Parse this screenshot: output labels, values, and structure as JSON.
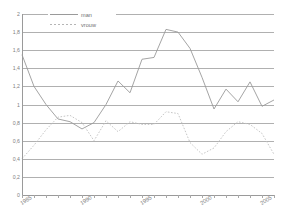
{
  "chart_data": {
    "type": "line",
    "title": "",
    "xlabel": "",
    "ylabel": "",
    "ylim": [
      0,
      2
    ],
    "xlim": [
      1985,
      2006
    ],
    "grid": true,
    "legend_position": "top-left",
    "y_ticks": [
      "2",
      "1,8",
      "1,6",
      "1,4",
      "1,2",
      "1",
      "0,8",
      "0,6",
      "0,4",
      "0,2",
      "0"
    ],
    "y_tick_values": [
      2,
      1.8,
      1.6,
      1.4,
      1.2,
      1,
      0.8,
      0.6,
      0.4,
      0.2,
      0
    ],
    "x_tick_labels": [
      "1985",
      "1990",
      "1995",
      "2000",
      "2005"
    ],
    "x_tick_values": [
      1985,
      1990,
      1995,
      2000,
      2005
    ],
    "x": [
      1985,
      1986,
      1987,
      1988,
      1989,
      1990,
      1991,
      1992,
      1993,
      1994,
      1995,
      1996,
      1997,
      1998,
      1999,
      2000,
      2001,
      2002,
      2003,
      2004,
      2005,
      2006
    ],
    "series": [
      {
        "name": "man",
        "style": "solid",
        "color": "#9a9a9a",
        "values": [
          1.55,
          1.2,
          1.0,
          0.84,
          0.81,
          0.73,
          0.8,
          1.0,
          1.26,
          1.13,
          1.5,
          1.52,
          1.83,
          1.8,
          1.62,
          1.3,
          0.95,
          1.17,
          1.03,
          1.25,
          0.98,
          1.05
        ]
      },
      {
        "name": "vrouw",
        "style": "dotted",
        "color": "#bfbfbf",
        "values": [
          0.4,
          0.55,
          0.72,
          0.86,
          0.88,
          0.8,
          0.6,
          0.82,
          0.7,
          0.81,
          0.78,
          0.78,
          0.92,
          0.9,
          0.58,
          0.45,
          0.52,
          0.7,
          0.81,
          0.78,
          0.68,
          0.45
        ]
      }
    ]
  }
}
